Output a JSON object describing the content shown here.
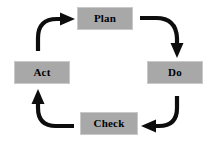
{
  "diagram": {
    "direction": "clockwise",
    "colors": {
      "node_fill": "#a8a8a8",
      "node_border": "#c9c9c9",
      "node_text": "#000000",
      "arrow": "#0d0d0d",
      "background": "#ffffff"
    },
    "nodes": [
      {
        "id": "plan",
        "label": "Plan",
        "position": "top"
      },
      {
        "id": "do",
        "label": "Do",
        "position": "right"
      },
      {
        "id": "check",
        "label": "Check",
        "position": "bottom"
      },
      {
        "id": "act",
        "label": "Act",
        "position": "left"
      }
    ],
    "arrows": [
      {
        "id": "plan-to-do",
        "from": "Plan",
        "to": "Do",
        "shape": "curve-right-down"
      },
      {
        "id": "do-to-check",
        "from": "Do",
        "to": "Check",
        "shape": "curve-down-left"
      },
      {
        "id": "check-to-act",
        "from": "Check",
        "to": "Act",
        "shape": "curve-left-up"
      },
      {
        "id": "act-to-plan",
        "from": "Act",
        "to": "Plan",
        "shape": "curve-up-right"
      }
    ]
  }
}
